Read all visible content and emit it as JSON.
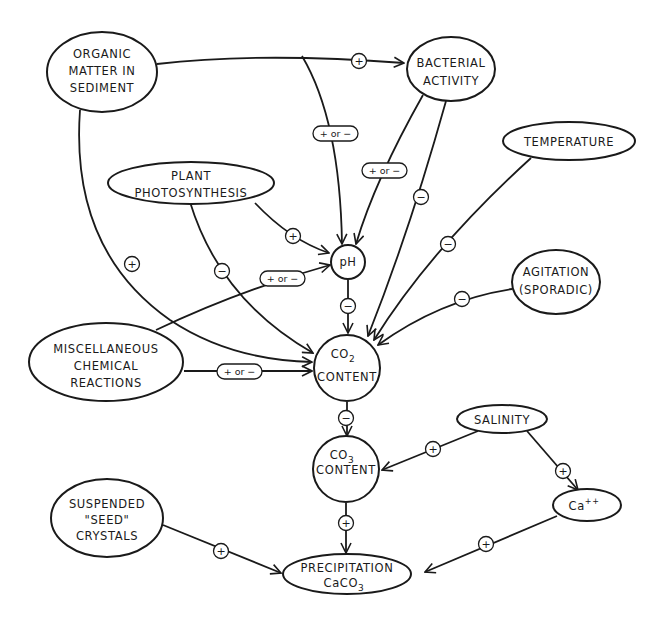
{
  "diagram": {
    "colors": {
      "ink": "#1a1a1a",
      "background": "#ffffff"
    },
    "nodes": {
      "organic": {
        "lines": [
          "ORGANIC",
          "MATTER IN",
          "SEDIMENT"
        ]
      },
      "bacterial": {
        "lines": [
          "BACTERIAL",
          "ACTIVITY"
        ]
      },
      "temperature": {
        "lines": [
          "TEMPERATURE"
        ]
      },
      "plant": {
        "lines": [
          "PLANT",
          "PHOTOSYNTHESIS"
        ]
      },
      "ph": {
        "lines": [
          "pH"
        ]
      },
      "agitation": {
        "lines": [
          "AGITATION",
          "(SPORADIC)"
        ]
      },
      "misc": {
        "lines": [
          "MISCELLANEOUS",
          "CHEMICAL",
          "REACTIONS"
        ]
      },
      "co2": {
        "line1": "CO",
        "sub": "2",
        "line2": "CONTENT"
      },
      "co3": {
        "line1": "CO",
        "sub": "3",
        "line2": "CONTENT"
      },
      "salinity": {
        "lines": [
          "SALINITY"
        ]
      },
      "ca": {
        "line1": "Ca",
        "sup": "++"
      },
      "seed": {
        "lines": [
          "SUSPENDED",
          "\"SEED\"",
          "CRYSTALS"
        ]
      },
      "precip": {
        "line1": "PRECIPITATION",
        "line2": "CaCO",
        "sub": "3"
      }
    },
    "edges": [
      {
        "from": "organic",
        "to": "bacterial",
        "sign": "+"
      },
      {
        "from": "organic",
        "to": "ph",
        "sign": "+ or -"
      },
      {
        "from": "organic",
        "to": "co2",
        "sign": "+"
      },
      {
        "from": "bacterial",
        "to": "ph",
        "sign": "+ or -"
      },
      {
        "from": "bacterial",
        "to": "co2",
        "sign": "-"
      },
      {
        "from": "temperature",
        "to": "co2",
        "sign": "-"
      },
      {
        "from": "plant",
        "to": "ph",
        "sign": "+"
      },
      {
        "from": "plant",
        "to": "co2",
        "sign": "-"
      },
      {
        "from": "misc",
        "to": "ph",
        "sign": "+ or -"
      },
      {
        "from": "misc",
        "to": "co2",
        "sign": "+ or -"
      },
      {
        "from": "agitation",
        "to": "co2",
        "sign": "-"
      },
      {
        "from": "ph",
        "to": "co2",
        "sign": "-"
      },
      {
        "from": "co2",
        "to": "co3",
        "sign": "-"
      },
      {
        "from": "salinity",
        "to": "co3",
        "sign": "+"
      },
      {
        "from": "salinity",
        "to": "ca",
        "sign": "+"
      },
      {
        "from": "co3",
        "to": "precip",
        "sign": "+"
      },
      {
        "from": "ca",
        "to": "precip",
        "sign": "+"
      },
      {
        "from": "seed",
        "to": "precip",
        "sign": "+"
      }
    ],
    "signs": {
      "plus": "+",
      "minus": "−",
      "plus_or_minus": "+ or −"
    }
  }
}
